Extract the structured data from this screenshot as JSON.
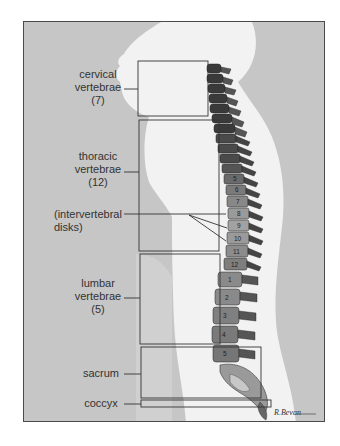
{
  "figure": {
    "labels": {
      "cervical": {
        "line1": "cervical",
        "line2": "vertebrae",
        "count": "(7)"
      },
      "thoracic": {
        "line1": "thoracic",
        "line2": "vertebrae",
        "count": "(12)"
      },
      "disks": {
        "line1": "(intervertebral",
        "line2": "disks)"
      },
      "lumbar": {
        "line1": "lumbar",
        "line2": "vertebrae",
        "count": "(5)"
      },
      "sacrum": "sacrum",
      "coccyx": "coccyx"
    },
    "thoracic_numbers": [
      "5",
      "6",
      "7",
      "8",
      "9",
      "10",
      "11",
      "12"
    ],
    "lumbar_numbers": [
      "1",
      "2",
      "3",
      "4",
      "5"
    ],
    "signature": "R.Bevan",
    "colors": {
      "background": "#c6c6c6",
      "silhouette": "#f2f2f2",
      "frame": "#4a4a4a",
      "bone_dark": "#3a3a3a",
      "bone_mid": "#7a7a7a",
      "bone_light": "#a8a8a8"
    }
  }
}
